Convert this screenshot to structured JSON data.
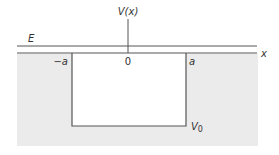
{
  "diagram": {
    "labels": {
      "potential_axis": "V(x)",
      "energy": "E",
      "x_axis": "x",
      "left_edge": "−a",
      "origin": "0",
      "right_edge": "a",
      "well_depth": "V",
      "well_depth_sub": "0"
    },
    "colors": {
      "background": "#ffffff",
      "shaded_region": "#ebebeb",
      "lines": "#555555",
      "text": "#333333"
    }
  }
}
